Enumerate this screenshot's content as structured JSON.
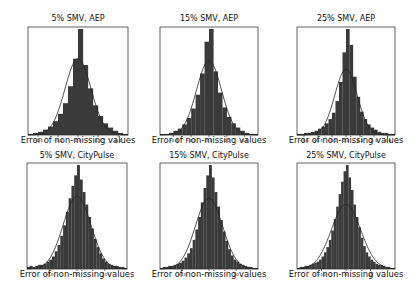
{
  "figure": {
    "background": "#ffffff",
    "bar_color": "#3a3a3a",
    "curve_color": "#222222"
  },
  "chart_data": [
    {
      "type": "bar",
      "title": "5% SMV, AEP",
      "xlabel": "Error of non-missing values",
      "ylabel": "",
      "xticks": [
        "-0.4",
        "-0.2",
        "0.0",
        "0.2",
        "0.4"
      ],
      "xtick_values": [
        -0.4,
        -0.2,
        0.0,
        0.2,
        0.4
      ],
      "xlim": [
        -0.5,
        0.5
      ],
      "bins": [
        -0.5,
        -0.45,
        -0.4,
        -0.35,
        -0.3,
        -0.25,
        -0.2,
        -0.15,
        -0.1,
        -0.05,
        0.0,
        0.05,
        0.1,
        0.15,
        0.2,
        0.25,
        0.3,
        0.35,
        0.4,
        0.45,
        0.5
      ],
      "values": [
        0.01,
        0.02,
        0.03,
        0.05,
        0.08,
        0.13,
        0.2,
        0.3,
        0.46,
        0.72,
        1.0,
        0.66,
        0.44,
        0.28,
        0.18,
        0.11,
        0.07,
        0.04,
        0.02,
        0.01
      ],
      "gaussian_overlay": {
        "mean": 0.0,
        "peak": 0.72,
        "sigma": 0.13
      }
    },
    {
      "type": "bar",
      "title": "15% SMV, AEP",
      "xlabel": "Error of non-missing values",
      "ylabel": "",
      "xticks": [
        "-0.4",
        "-0.2",
        "0.0",
        "0.2",
        "0.4"
      ],
      "xtick_values": [
        -0.4,
        -0.2,
        0.0,
        0.2,
        0.4
      ],
      "xlim": [
        -0.55,
        0.55
      ],
      "bins": [
        -0.55,
        -0.5,
        -0.45,
        -0.4,
        -0.35,
        -0.3,
        -0.25,
        -0.2,
        -0.15,
        -0.1,
        -0.05,
        0.0,
        0.05,
        0.1,
        0.15,
        0.2,
        0.25,
        0.3,
        0.35,
        0.4,
        0.45,
        0.5,
        0.55
      ],
      "values": [
        0.01,
        0.01,
        0.02,
        0.04,
        0.06,
        0.1,
        0.16,
        0.25,
        0.38,
        0.58,
        0.88,
        1.0,
        0.6,
        0.4,
        0.26,
        0.17,
        0.11,
        0.07,
        0.04,
        0.02,
        0.01,
        0.01
      ],
      "gaussian_overlay": {
        "mean": 0.0,
        "peak": 0.7,
        "sigma": 0.14
      }
    },
    {
      "type": "bar",
      "title": "25% SMV, AEP",
      "xlabel": "Error of non-missing values",
      "ylabel": "",
      "xticks": [
        "-0.6",
        "-0.4",
        "-0.2",
        "0.0",
        "0.2",
        "0.4",
        "0.6"
      ],
      "xtick_values": [
        -0.6,
        -0.4,
        -0.2,
        0.0,
        0.2,
        0.4,
        0.6
      ],
      "xlim": [
        -0.7,
        0.7
      ],
      "bins": [
        -0.7,
        -0.65,
        -0.6,
        -0.55,
        -0.5,
        -0.45,
        -0.4,
        -0.35,
        -0.3,
        -0.25,
        -0.2,
        -0.15,
        -0.1,
        -0.05,
        0.0,
        0.05,
        0.1,
        0.15,
        0.2,
        0.25,
        0.3,
        0.35,
        0.4,
        0.45,
        0.5,
        0.55,
        0.6,
        0.65,
        0.7
      ],
      "values": [
        0.01,
        0.01,
        0.02,
        0.02,
        0.03,
        0.04,
        0.06,
        0.08,
        0.11,
        0.15,
        0.21,
        0.32,
        0.5,
        0.78,
        1.0,
        0.85,
        0.55,
        0.36,
        0.22,
        0.15,
        0.1,
        0.07,
        0.05,
        0.03,
        0.02,
        0.02,
        0.01,
        0.01
      ],
      "gaussian_overlay": {
        "mean": 0.0,
        "peak": 0.62,
        "sigma": 0.16
      }
    },
    {
      "type": "bar",
      "title": "5% SMV, CityPulse",
      "xlabel": "Error of non-missing values",
      "ylabel": "",
      "xticks": [
        "-10",
        "0",
        "10"
      ],
      "xtick_values": [
        -10,
        0,
        10
      ],
      "xlim": [
        -18,
        18
      ],
      "bins_count": 36,
      "values": [
        0.02,
        0.03,
        0.02,
        0.03,
        0.04,
        0.04,
        0.05,
        0.07,
        0.09,
        0.12,
        0.17,
        0.23,
        0.32,
        0.42,
        0.55,
        0.68,
        0.8,
        0.9,
        1.0,
        0.86,
        0.74,
        0.62,
        0.5,
        0.39,
        0.29,
        0.21,
        0.15,
        0.1,
        0.07,
        0.05,
        0.04,
        0.03,
        0.03,
        0.02,
        0.02,
        0.01
      ],
      "gaussian_overlay": {
        "mean": 0.0,
        "peak": 0.7,
        "sigma": 5.0
      }
    },
    {
      "type": "bar",
      "title": "15% SMV, CityPulse",
      "xlabel": "Error of non-missing values",
      "ylabel": "",
      "xticks": [
        "-10",
        "0",
        "10"
      ],
      "xtick_values": [
        -10,
        0,
        10
      ],
      "xlim": [
        -18,
        18
      ],
      "bins_count": 36,
      "values": [
        0.01,
        0.02,
        0.02,
        0.03,
        0.03,
        0.04,
        0.05,
        0.06,
        0.08,
        0.11,
        0.15,
        0.2,
        0.28,
        0.38,
        0.5,
        0.64,
        0.78,
        0.9,
        1.0,
        0.88,
        0.74,
        0.6,
        0.47,
        0.36,
        0.27,
        0.19,
        0.13,
        0.09,
        0.07,
        0.05,
        0.04,
        0.03,
        0.02,
        0.02,
        0.01,
        0.01
      ],
      "gaussian_overlay": {
        "mean": 0.0,
        "peak": 0.68,
        "sigma": 5.0
      }
    },
    {
      "type": "bar",
      "title": "25% SMV, CityPulse",
      "xlabel": "Error of non-missing values",
      "ylabel": "",
      "xticks": [
        "-10",
        "0",
        "10"
      ],
      "xtick_values": [
        -10,
        0,
        10
      ],
      "xlim": [
        -20,
        20
      ],
      "bins_count": 40,
      "values": [
        0.01,
        0.02,
        0.02,
        0.03,
        0.03,
        0.04,
        0.05,
        0.06,
        0.07,
        0.09,
        0.12,
        0.16,
        0.21,
        0.28,
        0.37,
        0.48,
        0.6,
        0.72,
        0.84,
        0.94,
        1.0,
        0.88,
        0.76,
        0.62,
        0.5,
        0.4,
        0.3,
        0.22,
        0.16,
        0.12,
        0.09,
        0.07,
        0.05,
        0.04,
        0.04,
        0.03,
        0.02,
        0.02,
        0.01,
        0.01
      ],
      "gaussian_overlay": {
        "mean": 0.0,
        "peak": 0.62,
        "sigma": 6.0
      }
    }
  ],
  "panels": [
    {
      "title": "5% SMV, AEP",
      "xlabel": "Error of non-missing values"
    },
    {
      "title": "15% SMV, AEP",
      "xlabel": "Error of non-missing values"
    },
    {
      "title": "25% SMV, AEP",
      "xlabel": "Error of non-missing values"
    },
    {
      "title": "5% SMV, CityPulse",
      "xlabel": "Error of non-missing values"
    },
    {
      "title": "15% SMV, CityPulse",
      "xlabel": "Error of non-missing values"
    },
    {
      "title": "25% SMV, CityPulse",
      "xlabel": "Error of non-missing values"
    }
  ]
}
